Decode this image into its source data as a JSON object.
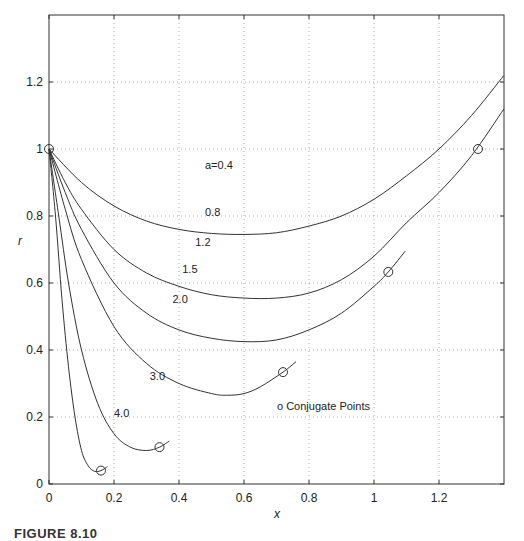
{
  "chart_data": {
    "type": "line",
    "title": "",
    "xlabel": "x",
    "ylabel": "r",
    "xlim": [
      0,
      1.4
    ],
    "ylim": [
      0,
      1.4
    ],
    "grid": true,
    "xticks": [
      "0",
      "0.2",
      "0.4",
      "0.6",
      "0.8",
      "1",
      "1.2"
    ],
    "yticks": [
      "0",
      "0.2",
      "0.4",
      "0.6",
      "0.8",
      "1",
      "1.2"
    ],
    "annotation": "o Conjugate Points",
    "start_point": {
      "x": 0,
      "r": 1.0
    },
    "series": [
      {
        "name": "a=0.4",
        "label": "a=0.4",
        "points": []
      },
      {
        "name": "0.8",
        "label": "0.8",
        "points": [
          [
            0,
            1.0
          ],
          [
            0.1,
            0.9
          ],
          [
            0.2,
            0.83
          ],
          [
            0.3,
            0.785
          ],
          [
            0.4,
            0.76
          ],
          [
            0.5,
            0.748
          ],
          [
            0.6,
            0.745
          ],
          [
            0.7,
            0.75
          ],
          [
            0.8,
            0.77
          ],
          [
            0.9,
            0.8
          ],
          [
            1.0,
            0.85
          ],
          [
            1.1,
            0.92
          ],
          [
            1.2,
            1.0
          ],
          [
            1.3,
            1.1
          ],
          [
            1.4,
            1.22
          ]
        ],
        "conjugate_point": null
      },
      {
        "name": "1.2",
        "label": "1.2",
        "points": [
          [
            0,
            1.0
          ],
          [
            0.05,
            0.9
          ],
          [
            0.1,
            0.82
          ],
          [
            0.2,
            0.7
          ],
          [
            0.3,
            0.63
          ],
          [
            0.4,
            0.59
          ],
          [
            0.5,
            0.565
          ],
          [
            0.6,
            0.555
          ],
          [
            0.7,
            0.555
          ],
          [
            0.8,
            0.57
          ],
          [
            0.9,
            0.61
          ],
          [
            1.0,
            0.68
          ],
          [
            1.1,
            0.78
          ],
          [
            1.2,
            0.87
          ],
          [
            1.3,
            0.98
          ],
          [
            1.4,
            1.12
          ]
        ],
        "conjugate_point": [
          1.32,
          1.0
        ]
      },
      {
        "name": "1.5",
        "label": "1.5",
        "points": [
          [
            0,
            1.0
          ],
          [
            0.05,
            0.87
          ],
          [
            0.1,
            0.76
          ],
          [
            0.2,
            0.6
          ],
          [
            0.3,
            0.51
          ],
          [
            0.4,
            0.46
          ],
          [
            0.5,
            0.435
          ],
          [
            0.6,
            0.425
          ],
          [
            0.7,
            0.43
          ],
          [
            0.8,
            0.46
          ],
          [
            0.9,
            0.51
          ],
          [
            1.0,
            0.59
          ],
          [
            1.044,
            0.633
          ],
          [
            1.096,
            0.695
          ]
        ],
        "conjugate_point": [
          1.044,
          0.633
        ]
      },
      {
        "name": "2.0",
        "label": "2.0",
        "points": [
          [
            0,
            1.0
          ],
          [
            0.05,
            0.82
          ],
          [
            0.1,
            0.67
          ],
          [
            0.2,
            0.47
          ],
          [
            0.3,
            0.36
          ],
          [
            0.4,
            0.3
          ],
          [
            0.5,
            0.27
          ],
          [
            0.55,
            0.265
          ],
          [
            0.6,
            0.27
          ],
          [
            0.65,
            0.29
          ],
          [
            0.72,
            0.334
          ],
          [
            0.76,
            0.365
          ]
        ],
        "conjugate_point": [
          0.72,
          0.334
        ]
      },
      {
        "name": "3.0",
        "label": "3.0",
        "points": [
          [
            0,
            1.0
          ],
          [
            0.03,
            0.8
          ],
          [
            0.06,
            0.6
          ],
          [
            0.1,
            0.4
          ],
          [
            0.15,
            0.24
          ],
          [
            0.2,
            0.15
          ],
          [
            0.25,
            0.11
          ],
          [
            0.3,
            0.1
          ],
          [
            0.34,
            0.11
          ],
          [
            0.37,
            0.128
          ]
        ],
        "conjugate_point": [
          0.34,
          0.11
        ]
      },
      {
        "name": "4.0",
        "label": "4.0",
        "points": [
          [
            0,
            1.0
          ],
          [
            0.02,
            0.8
          ],
          [
            0.04,
            0.55
          ],
          [
            0.06,
            0.35
          ],
          [
            0.08,
            0.2
          ],
          [
            0.1,
            0.1
          ],
          [
            0.12,
            0.055
          ],
          [
            0.14,
            0.038
          ],
          [
            0.16,
            0.04
          ],
          [
            0.18,
            0.052
          ]
        ],
        "conjugate_point": [
          0.16,
          0.04
        ]
      }
    ],
    "label_positions": [
      {
        "text": "a=0.4",
        "x": 0.48,
        "r": 0.94
      },
      {
        "text": "0.8",
        "x": 0.48,
        "r": 0.8
      },
      {
        "text": "1.2",
        "x": 0.45,
        "r": 0.71
      },
      {
        "text": "1.5",
        "x": 0.41,
        "r": 0.63
      },
      {
        "text": "2.0",
        "x": 0.38,
        "r": 0.54
      },
      {
        "text": "3.0",
        "x": 0.31,
        "r": 0.31
      },
      {
        "text": "4.0",
        "x": 0.2,
        "r": 0.2
      }
    ]
  },
  "caption": "FIGURE 8.10"
}
